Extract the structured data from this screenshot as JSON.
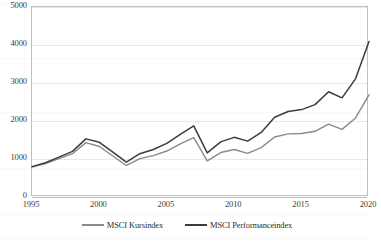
{
  "chart_data": {
    "type": "line",
    "title": "",
    "subtitle": "",
    "xlabel": "",
    "ylabel": "",
    "xlim": [
      1995,
      2020
    ],
    "ylim": [
      0,
      5000
    ],
    "ytick_labels": [
      "0",
      "1000",
      "2000",
      "3000",
      "4000",
      "5000"
    ],
    "ytick_values": [
      0,
      1000,
      2000,
      3000,
      4000,
      5000
    ],
    "xtick_labels": [
      "1995",
      "2000",
      "2005",
      "2010",
      "2015",
      "2020"
    ],
    "xtick_values": [
      1995,
      2000,
      2005,
      2010,
      2015,
      2020
    ],
    "grid": "horizontal",
    "legend_position": "bottom",
    "x": [
      1995,
      1996,
      1997,
      1998,
      1999,
      2000,
      2001,
      2002,
      2003,
      2004,
      2005,
      2006,
      2007,
      2008,
      2009,
      2010,
      2011,
      2012,
      2013,
      2014,
      2015,
      2016,
      2017,
      2018,
      2019,
      2020
    ],
    "series": [
      {
        "name": "MSCI Kursindex",
        "color": "#8a8a8a",
        "values": [
          790,
          880,
          1010,
          1140,
          1430,
          1330,
          1080,
          830,
          1010,
          1090,
          1210,
          1400,
          1560,
          950,
          1170,
          1250,
          1150,
          1300,
          1580,
          1660,
          1670,
          1730,
          1920,
          1780,
          2080,
          2690
        ]
      },
      {
        "name": "MSCI Performanceindex",
        "color": "#3c3c3c",
        "values": [
          800,
          900,
          1050,
          1200,
          1530,
          1440,
          1180,
          920,
          1140,
          1250,
          1410,
          1650,
          1870,
          1160,
          1450,
          1570,
          1470,
          1700,
          2100,
          2250,
          2300,
          2430,
          2770,
          2610,
          3110,
          4090
        ]
      }
    ],
    "annotations": []
  },
  "legend": {
    "entries": [
      {
        "label": "MSCI Kursindex"
      },
      {
        "label": "MSCI Performanceindex"
      }
    ]
  },
  "colors": {
    "kursindex": "#8a8a8a",
    "performanceindex": "#3c3c3c",
    "gridline": "#e8e8e8",
    "frame": "#bfbfbf",
    "text": "#3d3d3d",
    "background": "#ffffff"
  }
}
